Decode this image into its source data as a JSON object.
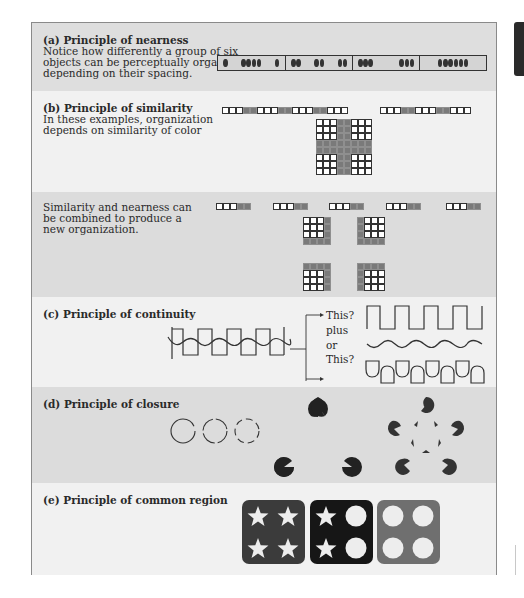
{
  "sections": {
    "nearness": {
      "title": "(a) Principle of nearness",
      "desc_lines": [
        "Notice how differently a group of six",
        "objects can be perceptually organized,",
        "depending on their spacing."
      ],
      "panels": [
        {
          "groups": [
            1,
            4,
            1
          ]
        },
        {
          "groups": [
            2,
            2,
            2
          ]
        },
        {
          "groups": [
            3,
            3
          ]
        },
        {
          "groups": [
            6
          ]
        }
      ]
    },
    "similarity": {
      "title": "(b) Principle of similarity",
      "desc_lines": [
        "In these examples, organization",
        "depends on similarity of color"
      ],
      "strip1": "WWWGGWWWGGWWWGGWWW",
      "strip2": "WWWGGWWWGGWWW",
      "grid": [
        "WWWGGWWW",
        "WWWGGWWW",
        "WWWGGWWW",
        "GGGGGGGG",
        "GGGGGGGG",
        "WWWGGWWW",
        "WWWGGWWW",
        "WWWGGWWW"
      ]
    },
    "combined": {
      "desc_lines": [
        "Similarity and nearness can",
        "be combined to produce a",
        "new organization."
      ],
      "strip_group": "WWWGG",
      "strip_count": 5,
      "grids": [
        [
          "WWWG",
          "WWWG",
          "WWWG",
          "GGGG"
        ],
        [
          "GWWW",
          "GWWW",
          "GWWW",
          "GGGG"
        ],
        [
          "GGGG",
          "WWWG",
          "WWWG",
          "WWWG"
        ],
        [
          "GGGG",
          "GWWW",
          "GWWW",
          "GWWW"
        ]
      ]
    },
    "continuity": {
      "title": "(c) Principle of continuity",
      "option1": "This?",
      "plus": "plus",
      "or": "or",
      "option2": "This?"
    },
    "closure": {
      "title": "(d) Principle of closure"
    },
    "common_region": {
      "title": "(e) Principle of common region",
      "boxes": [
        {
          "color": "#3b3b3b",
          "symbols": [
            "star",
            "star",
            "star",
            "star"
          ]
        },
        {
          "color": "#161616",
          "symbols": [
            "star",
            "circle",
            "star",
            "circle"
          ]
        },
        {
          "color": "#6f6f6f",
          "symbols": [
            "circle",
            "circle",
            "circle",
            "circle"
          ]
        }
      ]
    }
  },
  "colors": {
    "dot": "#333333",
    "symbol_fill": "#ededed"
  }
}
